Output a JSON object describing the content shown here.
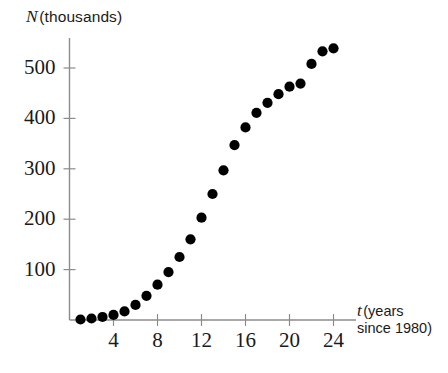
{
  "figure": {
    "background": "#ffffff",
    "ink_color": "#1a1a1a",
    "axis_color": "#8c8c8c",
    "point_color": "#000000"
  },
  "labels": {
    "y_axis_var": "N",
    "y_axis_unit": "(thousands)",
    "x_axis_var": "t",
    "x_axis_unit_line1": "(years",
    "x_axis_unit_line2": "since 1980)"
  },
  "chart_data": {
    "type": "scatter",
    "title": "",
    "xlabel": "t (years since 1980)",
    "ylabel": "N (thousands)",
    "xlim": [
      0,
      25.5
    ],
    "ylim": [
      0,
      560
    ],
    "grid": false,
    "legend": "none",
    "x_ticks": [
      4,
      8,
      12,
      16,
      20,
      24
    ],
    "y_ticks": [
      100,
      200,
      300,
      400,
      500
    ],
    "x_tick_labels": [
      "4",
      "8",
      "12",
      "16",
      "20",
      "24"
    ],
    "y_tick_labels": [
      "100",
      "200",
      "300",
      "400",
      "500"
    ],
    "series": [
      {
        "name": "N",
        "x": [
          1,
          2,
          3,
          4,
          5,
          6,
          7,
          8,
          9,
          10,
          11,
          12,
          13,
          14,
          15,
          16,
          17,
          18,
          19,
          20,
          21,
          22,
          23,
          24
        ],
        "y": [
          1,
          3,
          6,
          10,
          17,
          30,
          48,
          70,
          95,
          125,
          160,
          203,
          250,
          297,
          347,
          382,
          411,
          431,
          448,
          463,
          469,
          508,
          533,
          539
        ]
      }
    ]
  }
}
